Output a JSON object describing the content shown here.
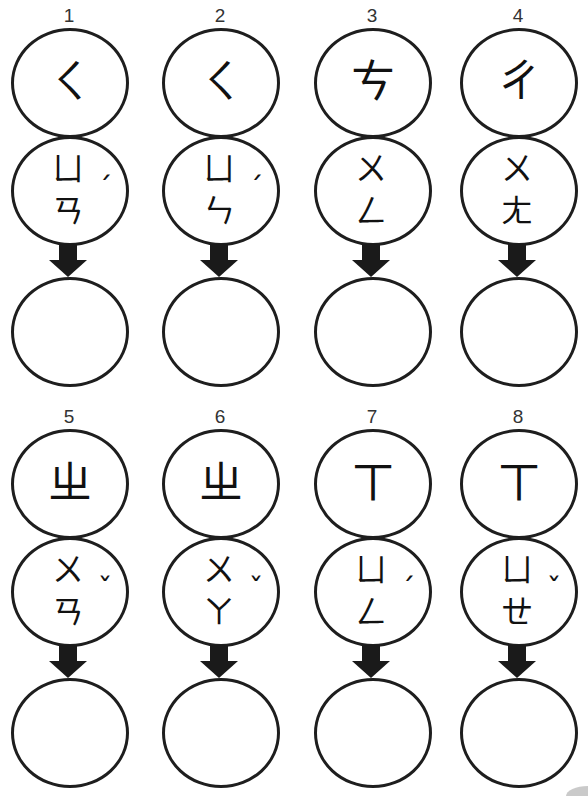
{
  "worksheet": {
    "rows": [
      {
        "items": [
          {
            "number": "1",
            "initial": "ㄑ",
            "medial": "ㄩ",
            "final": "ㄢ",
            "tone": "ˊ",
            "answer": ""
          },
          {
            "number": "2",
            "initial": "ㄑ",
            "medial": "ㄩ",
            "final": "ㄣ",
            "tone": "ˊ",
            "answer": ""
          },
          {
            "number": "3",
            "initial": "ㄘ",
            "medial": "ㄨ",
            "final": "ㄥ",
            "tone": "",
            "answer": ""
          },
          {
            "number": "4",
            "initial": "ㄔ",
            "medial": "ㄨ",
            "final": "ㄤ",
            "tone": "",
            "answer": ""
          }
        ]
      },
      {
        "items": [
          {
            "number": "5",
            "initial": "ㄓ",
            "medial": "ㄨ",
            "final": "ㄢ",
            "tone": "ˇ",
            "answer": ""
          },
          {
            "number": "6",
            "initial": "ㄓ",
            "medial": "ㄨ",
            "final": "ㄚ",
            "tone": "ˇ",
            "answer": ""
          },
          {
            "number": "7",
            "initial": "ㄒ",
            "medial": "ㄩ",
            "final": "ㄥ",
            "tone": "ˊ",
            "answer": ""
          },
          {
            "number": "8",
            "initial": "ㄒ",
            "medial": "ㄩ",
            "final": "ㄝ",
            "tone": "ˇ",
            "answer": ""
          }
        ]
      }
    ],
    "arrow_icon": "down-arrow-icon",
    "colors": {
      "stroke": "#1e1e1e",
      "background": "#ffffff"
    }
  }
}
